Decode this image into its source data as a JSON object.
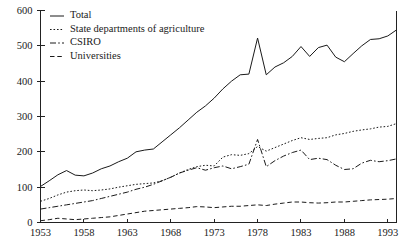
{
  "chart_data": {
    "type": "line",
    "title": "",
    "subtitle": "",
    "xlabel": "",
    "ylabel": "",
    "xlim": [
      1953,
      1994
    ],
    "ylim": [
      0,
      600
    ],
    "grid": false,
    "legend_position": "top-left",
    "y_ticks": [
      0,
      100,
      200,
      300,
      400,
      500,
      600
    ],
    "y_tick_labels": [
      "0",
      "100",
      "200",
      "300",
      "400",
      "500",
      "600"
    ],
    "x_ticks": [
      1953,
      1958,
      1963,
      1968,
      1973,
      1978,
      1983,
      1988,
      1993
    ],
    "x_tick_labels": [
      "1953",
      "1958",
      "1963",
      "1968",
      "1973",
      "1978",
      "1983",
      "1988",
      "1993"
    ],
    "x": [
      1953,
      1954,
      1955,
      1956,
      1957,
      1958,
      1959,
      1960,
      1961,
      1962,
      1963,
      1964,
      1965,
      1966,
      1967,
      1968,
      1969,
      1970,
      1971,
      1972,
      1973,
      1974,
      1975,
      1976,
      1977,
      1978,
      1979,
      1980,
      1981,
      1982,
      1983,
      1984,
      1985,
      1986,
      1987,
      1988,
      1989,
      1990,
      1991,
      1992,
      1993,
      1994
    ],
    "series": [
      {
        "name": "Total",
        "style": "solid",
        "values": [
          102,
          118,
          135,
          147,
          134,
          132,
          140,
          152,
          160,
          172,
          182,
          200,
          205,
          208,
          228,
          248,
          268,
          290,
          312,
          330,
          352,
          378,
          400,
          418,
          420,
          522,
          418,
          440,
          452,
          470,
          498,
          470,
          495,
          502,
          468,
          455,
          478,
          500,
          518,
          520,
          528,
          545
        ]
      },
      {
        "name": "State departments of agriculture",
        "style": "dotted",
        "values": [
          60,
          68,
          78,
          86,
          90,
          92,
          90,
          92,
          95,
          100,
          104,
          108,
          110,
          112,
          118,
          128,
          140,
          150,
          158,
          162,
          160,
          185,
          192,
          190,
          195,
          215,
          202,
          212,
          222,
          232,
          240,
          235,
          238,
          240,
          248,
          252,
          258,
          262,
          265,
          270,
          272,
          280
        ]
      },
      {
        "name": "CSIRO",
        "style": "dashdot",
        "values": [
          38,
          42,
          46,
          50,
          54,
          58,
          62,
          68,
          74,
          80,
          86,
          94,
          100,
          108,
          118,
          128,
          140,
          148,
          155,
          148,
          155,
          160,
          152,
          158,
          165,
          235,
          158,
          175,
          188,
          198,
          205,
          178,
          182,
          178,
          162,
          150,
          152,
          168,
          176,
          172,
          175,
          180
        ]
      },
      {
        "name": "Universities",
        "style": "dashed",
        "values": [
          5,
          8,
          12,
          10,
          8,
          10,
          12,
          14,
          16,
          20,
          24,
          28,
          32,
          34,
          36,
          38,
          40,
          42,
          45,
          44,
          42,
          44,
          46,
          46,
          48,
          50,
          48,
          52,
          55,
          58,
          58,
          56,
          55,
          56,
          58,
          58,
          60,
          62,
          64,
          65,
          66,
          68
        ]
      }
    ],
    "legend": [
      {
        "label": "Total",
        "style": "solid"
      },
      {
        "label": "State departments of agriculture",
        "style": "dotted"
      },
      {
        "label": "CSIRO",
        "style": "dashdot"
      },
      {
        "label": "Universities",
        "style": "dashed"
      }
    ]
  }
}
